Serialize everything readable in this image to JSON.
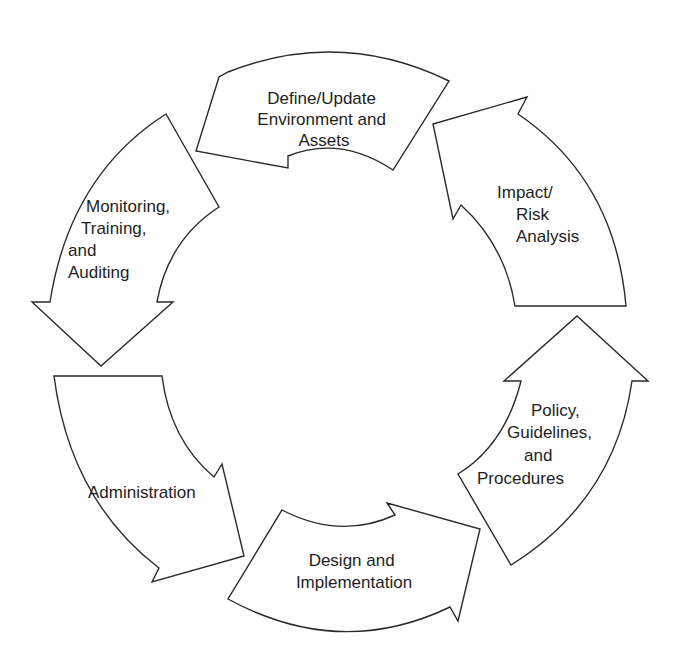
{
  "diagram": {
    "type": "cycle",
    "direction": "counter-clockwise",
    "background": "#ffffff",
    "stroke_color": "#2a2a2a",
    "text_color": "#1e1e1e",
    "steps": [
      {
        "id": "define",
        "lines": [
          "Define/Update",
          "Environment and",
          "Assets"
        ]
      },
      {
        "id": "monitoring",
        "lines": [
          "Monitoring,",
          "Training,",
          "and",
          "Auditing"
        ]
      },
      {
        "id": "administration",
        "lines": [
          "Administration"
        ]
      },
      {
        "id": "design",
        "lines": [
          "Design and",
          "Implementation"
        ]
      },
      {
        "id": "policy",
        "lines": [
          "Policy,",
          "Guidelines,",
          "and",
          "Procedures"
        ]
      },
      {
        "id": "impact",
        "lines": [
          "Impact/",
          "Risk",
          "Analysis"
        ]
      }
    ],
    "flow": [
      [
        "define",
        "monitoring"
      ],
      [
        "monitoring",
        "administration"
      ],
      [
        "administration",
        "design"
      ],
      [
        "design",
        "policy"
      ],
      [
        "policy",
        "impact"
      ],
      [
        "impact",
        "define"
      ]
    ]
  }
}
